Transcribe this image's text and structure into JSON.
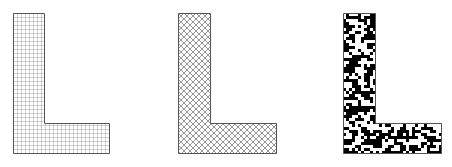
{
  "figure": {
    "shapes": [
      {
        "id": "l-shape-grid",
        "pattern": "square-grid",
        "x": 13,
        "y": 13,
        "stem_width": 31,
        "total_width": 96,
        "total_height": 140,
        "foot_height": 30,
        "stroke": "#555555",
        "fill_line": "#888888",
        "cell": 4
      },
      {
        "id": "l-shape-crosshatch",
        "pattern": "diagonal-crosshatch",
        "x": 178,
        "y": 13,
        "stem_width": 32,
        "total_width": 98,
        "total_height": 140,
        "foot_height": 30,
        "stroke": "#555555",
        "fill_line": "#888888",
        "cell": 6
      },
      {
        "id": "l-shape-random",
        "pattern": "random-binary",
        "x": 343,
        "y": 13,
        "stem_width": 32,
        "total_width": 98,
        "total_height": 140,
        "foot_height": 30,
        "stroke": "#555555",
        "fill_dark": "#000000",
        "fill_light": "#ffffff",
        "cell": 3
      }
    ]
  }
}
